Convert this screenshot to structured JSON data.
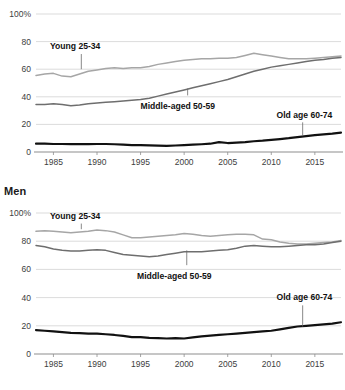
{
  "figure": {
    "x_ticks": [
      1985,
      1990,
      1995,
      2000,
      2005,
      2010,
      2015
    ],
    "y_ticks": [
      "0",
      "20",
      "40",
      "60",
      "80",
      "100%"
    ],
    "colors": {
      "young": "#a6a6a6",
      "middle": "#6e6e6e",
      "old": "#111111",
      "grid": "#d2d2d2",
      "axis": "#8e8e8e"
    }
  },
  "panels": [
    {
      "id": "women",
      "title": "",
      "annotations": [
        {
          "label": "Young 25-34",
          "text_x": 1984.6,
          "text_y": 74.5,
          "leader_x": 1988.2,
          "leader_top": 71.0,
          "leader_bottom": 60.0
        },
        {
          "label": "Middle-aged 50-59",
          "text_x": 1995.0,
          "text_y": 31.0,
          "leader_x": 2000.4,
          "leader_top": 41.0,
          "leader_bottom": 46.0
        },
        {
          "label": "Old age 60-74",
          "text_x": 2010.6,
          "text_y": 25.0,
          "leader_x": 2013.6,
          "leader_top": 21.5,
          "leader_bottom": 11.5
        }
      ],
      "chart_data": {
        "type": "line",
        "title": "",
        "xlabel": "",
        "ylabel": "",
        "xlim": [
          1983,
          2018
        ],
        "ylim": [
          0,
          100
        ],
        "grid": true,
        "legend": "inline-annotations",
        "x": [
          1983,
          1984,
          1985,
          1986,
          1987,
          1988,
          1989,
          1990,
          1991,
          1992,
          1993,
          1994,
          1995,
          1996,
          1997,
          1998,
          1999,
          2000,
          2001,
          2002,
          2003,
          2004,
          2005,
          2006,
          2007,
          2008,
          2009,
          2010,
          2011,
          2012,
          2013,
          2014,
          2015,
          2016,
          2017,
          2018
        ],
        "series": [
          {
            "name": "Young 25-34",
            "color": "#a6a6a6",
            "values": [
              55.5,
              56.5,
              57.0,
              55.0,
              54.5,
              56.5,
              58.5,
              59.5,
              60.5,
              61.0,
              60.5,
              61.0,
              61.0,
              62.0,
              63.5,
              64.5,
              65.5,
              66.5,
              67.0,
              67.5,
              67.5,
              68.0,
              68.0,
              68.5,
              70.0,
              71.5,
              70.5,
              69.5,
              68.5,
              67.5,
              67.5,
              67.5,
              68.0,
              68.5,
              69.0,
              69.5
            ]
          },
          {
            "name": "Middle-aged 50-59",
            "color": "#6e6e6e",
            "values": [
              34.5,
              34.5,
              35.0,
              34.5,
              33.5,
              34.0,
              35.0,
              35.5,
              36.0,
              36.5,
              37.0,
              37.5,
              38.0,
              39.0,
              40.5,
              42.0,
              43.5,
              45.0,
              46.5,
              48.0,
              49.5,
              51.0,
              52.5,
              54.5,
              56.5,
              58.5,
              60.0,
              61.5,
              62.5,
              63.5,
              64.5,
              65.5,
              66.5,
              67.0,
              68.0,
              68.5
            ]
          },
          {
            "name": "Old age 60-74",
            "color": "#111111",
            "values": [
              6.0,
              6.0,
              5.8,
              5.8,
              5.7,
              5.7,
              5.7,
              5.8,
              5.8,
              5.6,
              5.4,
              5.0,
              5.0,
              4.8,
              4.6,
              4.5,
              4.7,
              5.0,
              5.3,
              5.6,
              6.0,
              7.2,
              6.5,
              6.8,
              7.2,
              7.8,
              8.2,
              8.8,
              9.4,
              10.0,
              10.8,
              11.5,
              12.2,
              12.8,
              13.3,
              14.0
            ]
          }
        ]
      }
    },
    {
      "id": "men",
      "title": "Men",
      "annotations": [
        {
          "label": "Young 25-34",
          "text_x": 1984.6,
          "text_y": 96.0,
          "leader_x": 1988.2,
          "leader_top": 92.5,
          "leader_bottom": 88.5
        },
        {
          "label": "Middle-aged 50-59",
          "text_x": 1994.6,
          "text_y": 53.0,
          "leader_x": 2000.3,
          "leader_top": 63.0,
          "leader_bottom": 73.5
        },
        {
          "label": "Old age 60-74",
          "text_x": 2010.6,
          "text_y": 38.0,
          "leader_x": 2013.6,
          "leader_top": 34.5,
          "leader_bottom": 19.5
        }
      ],
      "chart_data": {
        "type": "line",
        "title": "Men",
        "xlabel": "",
        "ylabel": "",
        "xlim": [
          1983,
          2018
        ],
        "ylim": [
          0,
          100
        ],
        "grid": true,
        "legend": "inline-annotations",
        "x": [
          1983,
          1984,
          1985,
          1986,
          1987,
          1988,
          1989,
          1990,
          1991,
          1992,
          1993,
          1994,
          1995,
          1996,
          1997,
          1998,
          1999,
          2000,
          2001,
          2002,
          2003,
          2004,
          2005,
          2006,
          2007,
          2008,
          2009,
          2010,
          2011,
          2012,
          2013,
          2014,
          2015,
          2016,
          2017,
          2018
        ],
        "series": [
          {
            "name": "Young 25-34",
            "color": "#a6a6a6",
            "values": [
              87.0,
              87.5,
              87.0,
              86.5,
              86.0,
              86.5,
              87.0,
              88.0,
              87.5,
              86.5,
              84.5,
              82.5,
              82.5,
              83.0,
              83.5,
              84.0,
              84.5,
              85.5,
              85.0,
              84.0,
              83.5,
              84.0,
              84.5,
              85.0,
              85.0,
              84.5,
              81.5,
              81.0,
              79.5,
              78.5,
              78.0,
              78.0,
              78.5,
              79.0,
              79.5,
              80.5
            ]
          },
          {
            "name": "Middle-aged 50-59",
            "color": "#6e6e6e",
            "values": [
              77.0,
              76.0,
              74.5,
              73.5,
              73.0,
              73.0,
              73.5,
              74.0,
              73.5,
              72.0,
              70.5,
              70.0,
              69.5,
              69.0,
              69.5,
              70.5,
              71.5,
              72.5,
              72.5,
              72.5,
              73.0,
              73.5,
              74.0,
              75.0,
              76.5,
              77.0,
              76.5,
              76.0,
              76.0,
              76.5,
              77.0,
              77.5,
              77.5,
              78.0,
              79.0,
              80.0
            ]
          },
          {
            "name": "Old age 60-74",
            "color": "#111111",
            "values": [
              17.0,
              16.5,
              16.0,
              15.5,
              15.0,
              14.8,
              14.5,
              14.5,
              14.0,
              13.5,
              12.8,
              12.0,
              12.0,
              11.5,
              11.3,
              11.0,
              11.2,
              11.0,
              11.8,
              12.5,
              13.0,
              13.5,
              14.0,
              14.5,
              15.0,
              15.5,
              16.0,
              16.5,
              17.5,
              18.5,
              19.5,
              20.0,
              20.5,
              21.0,
              21.5,
              22.5
            ]
          }
        ]
      }
    }
  ]
}
